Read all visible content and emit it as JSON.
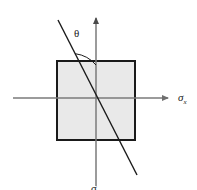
{
  "figure": {
    "name": "stress-element-plane-orientation-diagram",
    "background_color": "#ffffff",
    "element": {
      "name": "stress-element-square",
      "fill_color": "#e9e9e9",
      "stroke_color": "#1a1a1a",
      "stroke_width": 2,
      "x": 56,
      "y": 60,
      "width": 79,
      "height": 80
    },
    "axes": {
      "color": "#7a7a7a",
      "origin": {
        "x": 96,
        "y": 98
      },
      "horizontal": {
        "name": "sigma-x-axis",
        "label": "σ",
        "subscript": "x",
        "x_start": 13,
        "x_end": 173,
        "y": 98,
        "arrow": "right"
      },
      "vertical": {
        "name": "sigma-y-axis",
        "label": "σ",
        "subscript": "y",
        "y_start": 186,
        "y_end": 13,
        "x": 96,
        "arrow": "up"
      }
    },
    "inclined_line": {
      "name": "inclined-plane-line",
      "color": "#1a1a1a",
      "stroke_width": 1.4,
      "x1": 58,
      "y1": 20,
      "x2": 137,
      "y2": 175
    },
    "angle": {
      "name": "theta-angle",
      "symbol": "θ",
      "label_x": 77,
      "label_y": 36,
      "arc_color": "#1a1a1a",
      "arc_radius": 33
    }
  }
}
